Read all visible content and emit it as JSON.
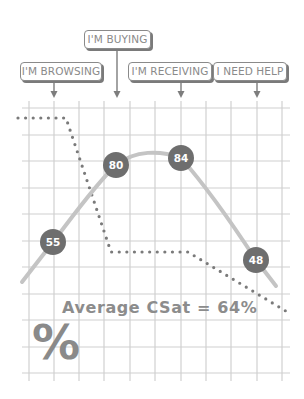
{
  "stages": [
    {
      "label": "I'M BROWSING",
      "x": 20,
      "y": 62,
      "w": 82,
      "arrow_x": 54,
      "arrow_top": 81
    },
    {
      "label": "I'M BUYING",
      "x": 84,
      "y": 30,
      "w": 67,
      "arrow_x": 117,
      "arrow_top": 49
    },
    {
      "label": "I'M RECEIVING",
      "x": 128,
      "y": 62,
      "w": 84,
      "arrow_x": 181,
      "arrow_top": 81
    },
    {
      "label": "I NEED HELP",
      "x": 213,
      "y": 62,
      "w": 74,
      "arrow_x": 257,
      "arrow_top": 81
    }
  ],
  "summary": {
    "average_text": "Average CSat = 64%",
    "symbol": "%"
  },
  "colors": {
    "grid": "#d0d0d0",
    "curve": "#c4c4c4",
    "marker": "#6e6e6e",
    "marker_text": "#ffffff",
    "dots": "#7a7a7a",
    "label_border": "#8a8a8a",
    "text": "#8a8a8a"
  },
  "chart_data": {
    "type": "line",
    "title": "",
    "xlabel": "",
    "ylabel": "",
    "categories": [
      "I'M BROWSING",
      "I'M BUYING",
      "I'M RECEIVING",
      "I NEED HELP"
    ],
    "series": [
      {
        "name": "CSat",
        "style": "smooth solid line with circular markers",
        "values": [
          55,
          80,
          84,
          48
        ]
      },
      {
        "name": "Engagement trend (dotted)",
        "style": "dotted step-down line",
        "values": [
          null,
          null,
          null,
          null
        ]
      }
    ],
    "annotations": [
      "Average CSat = 64%",
      "%"
    ],
    "grid": true,
    "legend": "none",
    "points": [
      {
        "label": "55",
        "cx": 53,
        "cy": 242
      },
      {
        "label": "80",
        "cx": 116,
        "cy": 165
      },
      {
        "label": "84",
        "cx": 181,
        "cy": 158
      },
      {
        "label": "48",
        "cx": 256,
        "cy": 260
      }
    ]
  }
}
